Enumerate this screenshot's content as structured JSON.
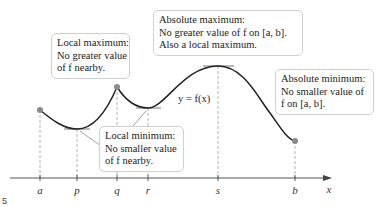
{
  "diagram": {
    "curve_label": "y = f(x)",
    "axis_label": "x",
    "ticks": [
      {
        "label": "a",
        "x": 40
      },
      {
        "label": "p",
        "x": 77
      },
      {
        "label": "q",
        "x": 117
      },
      {
        "label": "r",
        "x": 148
      },
      {
        "label": "s",
        "x": 218
      },
      {
        "label": "b",
        "x": 295
      }
    ],
    "annotations": {
      "local_max": {
        "title": "Local maximum:",
        "line2": "No greater value",
        "line3": "of f nearby."
      },
      "abs_max": {
        "title": "Absolute maximum:",
        "line2": "No greater value of f on [a, b].",
        "line3": "Also a local maximum."
      },
      "local_min": {
        "title": "Local minimum:",
        "line2": "No smaller value",
        "line3": "of f nearby."
      },
      "abs_min": {
        "title": "Absolute minimum:",
        "line2": "No smaller value of",
        "line3": "f on [a, b]."
      }
    },
    "figure_mark": "5",
    "colors": {
      "curve": "#222222",
      "guide": "#9a9a9a",
      "endpoint": "#8a8a8a",
      "box_border": "#cfcfcf"
    }
  }
}
